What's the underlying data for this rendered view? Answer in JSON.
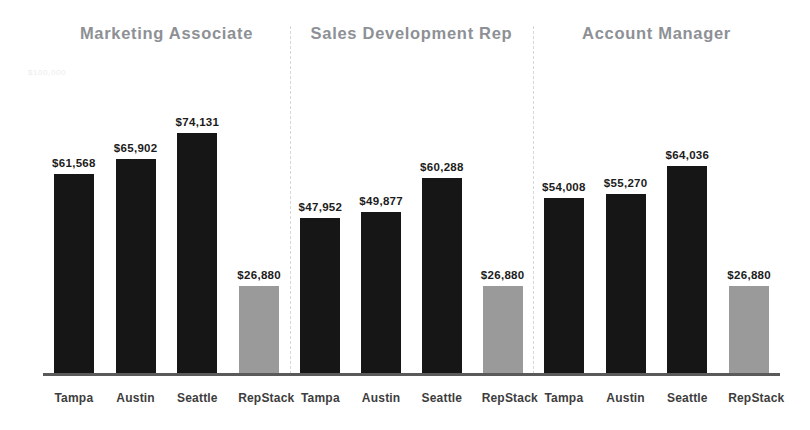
{
  "chart_data": {
    "type": "bar",
    "title": "",
    "xlabel": "",
    "ylabel": "",
    "axis_note": "$100,000",
    "categories": [
      "Tampa",
      "Austin",
      "Seattle",
      "RepStack"
    ],
    "ylim": [
      0,
      100000
    ],
    "grid": false,
    "legend": "none",
    "value_prefix": "$",
    "colors": {
      "bar": "#161616",
      "accent_bar": "#9a9a9a",
      "title": "#8d9095",
      "axis": "#5a5a5a",
      "divider": "#d7d7d7",
      "label": "#1c1c1c"
    },
    "panels": [
      {
        "title": "Marketing Associate",
        "values": [
          61568,
          65902,
          74131,
          26880
        ],
        "value_labels": [
          "$61,568",
          "$65,902",
          "$74,131",
          "$26,880"
        ],
        "accent_index": 3
      },
      {
        "title": "Sales Development Rep",
        "values": [
          47952,
          49877,
          60288,
          26880
        ],
        "value_labels": [
          "$47,952",
          "$49,877",
          "$60,288",
          "$26,880"
        ],
        "accent_index": 3
      },
      {
        "title": "Account Manager",
        "values": [
          54008,
          55270,
          64036,
          26880
        ],
        "value_labels": [
          "$54,008",
          "$55,270",
          "$64,036",
          "$26,880"
        ],
        "accent_index": 3
      }
    ]
  }
}
